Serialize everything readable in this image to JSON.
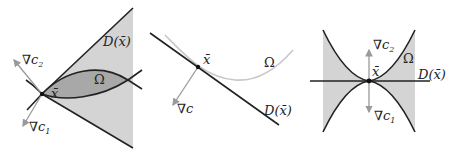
{
  "figure": {
    "panels": [
      {
        "id": "panel-1",
        "labels": {
          "cone": "D(x̄)",
          "region": "Ω",
          "point": "x̄",
          "grad_c2": "∇c",
          "grad_c2_sub": "2",
          "grad_c1": "∇c",
          "grad_c1_sub": "1"
        }
      },
      {
        "id": "panel-2",
        "labels": {
          "point": "x̄",
          "region": "Ω",
          "grad": "∇c",
          "cone": "D(x̄)"
        }
      },
      {
        "id": "panel-3",
        "labels": {
          "grad_c2": "∇c",
          "grad_c2_sub": "2",
          "point": "x̄",
          "region": "Ω",
          "cone": "D(x̄)",
          "grad_c1": "∇c",
          "grad_c1_sub": "1"
        }
      }
    ],
    "colors": {
      "cone_fill": "#d4d4d4",
      "region_fill": "#a8a8a8",
      "curve": "#222222",
      "light_curve": "#c8c8c8",
      "arrow": "#9a9a9a"
    }
  }
}
